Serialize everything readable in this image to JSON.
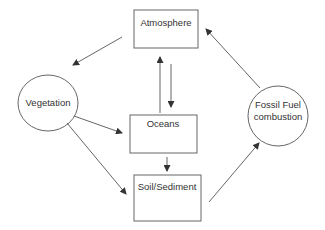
{
  "diagram": {
    "nodes": [
      {
        "id": "atmosphere",
        "label": "Atmosphere",
        "shape": "box"
      },
      {
        "id": "vegetation",
        "label": "Vegetation",
        "shape": "ellipse"
      },
      {
        "id": "oceans",
        "label": "Oceans",
        "shape": "box"
      },
      {
        "id": "soil",
        "label": "Soil/Sediment",
        "shape": "box"
      },
      {
        "id": "fossil",
        "label_line1": "Fossil Fuel",
        "label_line2": "combustion",
        "shape": "ellipse"
      }
    ],
    "edges": [
      {
        "from": "atmosphere",
        "to": "vegetation"
      },
      {
        "from": "atmosphere",
        "to": "oceans"
      },
      {
        "from": "oceans",
        "to": "atmosphere"
      },
      {
        "from": "vegetation",
        "to": "oceans"
      },
      {
        "from": "vegetation",
        "to": "soil"
      },
      {
        "from": "oceans",
        "to": "soil"
      },
      {
        "from": "soil",
        "to": "fossil"
      },
      {
        "from": "fossil",
        "to": "atmosphere"
      }
    ],
    "colors": {
      "stroke": "#555555",
      "text": "#333333",
      "background": "#ffffff"
    }
  }
}
